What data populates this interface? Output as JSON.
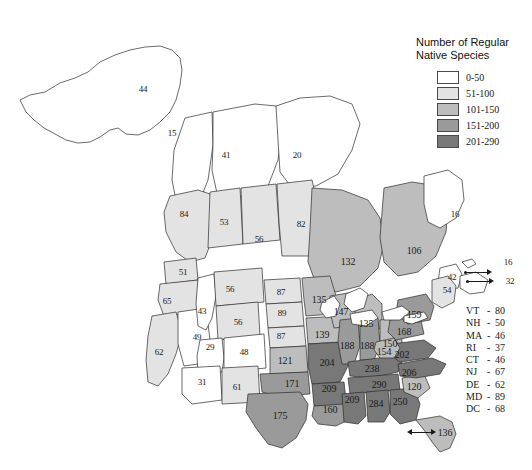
{
  "legend": {
    "title": "Number of Regular\nNative Species",
    "items": [
      {
        "label": "0-50",
        "color": "#ffffff"
      },
      {
        "label": "51-100",
        "color": "#e3e3e3"
      },
      {
        "label": "101-150",
        "color": "#bdbdbd"
      },
      {
        "label": "151-200",
        "color": "#9a9a9a"
      },
      {
        "label": "201-290",
        "color": "#787878"
      }
    ]
  },
  "state_list": [
    {
      "abbr": "VT",
      "value": "80"
    },
    {
      "abbr": "NH",
      "value": "50"
    },
    {
      "abbr": "MA",
      "value": "46"
    },
    {
      "abbr": "RI",
      "value": "37"
    },
    {
      "abbr": "CT",
      "value": "46"
    },
    {
      "abbr": "NJ",
      "value": "67"
    },
    {
      "abbr": "DE",
      "value": "62"
    },
    {
      "abbr": "MD",
      "value": "89"
    },
    {
      "abbr": "DC",
      "value": "68"
    }
  ],
  "chart_data": {
    "type": "map",
    "title": "Number of Regular Native Species",
    "legend_bins": [
      "0-50",
      "51-100",
      "101-150",
      "151-200",
      "201-290"
    ],
    "legend_colors": [
      "#ffffff",
      "#e3e3e3",
      "#bdbdbd",
      "#9a9a9a",
      "#787878"
    ],
    "regions": [
      {
        "name": "Alaska",
        "value": 44,
        "bin": "0-50",
        "x": 143,
        "y": 89
      },
      {
        "name": "Yukon",
        "value": 15,
        "bin": "0-50",
        "x": 172,
        "y": 133
      },
      {
        "name": "Northwest Territories",
        "value": 41,
        "bin": "0-50",
        "x": 226,
        "y": 155
      },
      {
        "name": "Nunavut",
        "value": 20,
        "bin": "0-50",
        "x": 297,
        "y": 155
      },
      {
        "name": "British Columbia",
        "value": 84,
        "bin": "51-100",
        "x": 184,
        "y": 214
      },
      {
        "name": "Alberta",
        "value": 53,
        "bin": "51-100",
        "x": 224,
        "y": 222
      },
      {
        "name": "Saskatchewan",
        "value": 56,
        "bin": "51-100",
        "x": 259,
        "y": 239
      },
      {
        "name": "Manitoba",
        "value": 82,
        "bin": "51-100",
        "x": 301,
        "y": 224
      },
      {
        "name": "Ontario",
        "value": 132,
        "bin": "101-150",
        "x": 348,
        "y": 261
      },
      {
        "name": "Quebec",
        "value": 106,
        "bin": "101-150",
        "x": 414,
        "y": 250
      },
      {
        "name": "Newfoundland and Labrador",
        "value": 16,
        "bin": "0-50",
        "x": 455,
        "y": 214
      },
      {
        "name": "New Brunswick",
        "value": 42,
        "bin": "0-50",
        "x": 452,
        "y": 277
      },
      {
        "name": "Prince Edward Island",
        "value": 16,
        "bin": "0-50",
        "x": 508,
        "y": 262
      },
      {
        "name": "Nova Scotia",
        "value": 32,
        "bin": "0-50",
        "x": 510,
        "y": 281
      },
      {
        "name": "Maine",
        "value": 54,
        "bin": "51-100",
        "x": 447,
        "y": 290
      },
      {
        "name": "Washington",
        "value": 51,
        "bin": "51-100",
        "x": 183,
        "y": 272
      },
      {
        "name": "Oregon",
        "value": 65,
        "bin": "51-100",
        "x": 167,
        "y": 301
      },
      {
        "name": "California",
        "value": 62,
        "bin": "51-100",
        "x": 159,
        "y": 352
      },
      {
        "name": "Nevada",
        "value": 49,
        "bin": "0-50",
        "x": 197,
        "y": 337
      },
      {
        "name": "Idaho",
        "value": 43,
        "bin": "0-50",
        "x": 202,
        "y": 311
      },
      {
        "name": "Montana",
        "value": 56,
        "bin": "51-100",
        "x": 230,
        "y": 289
      },
      {
        "name": "Wyoming",
        "value": 56,
        "bin": "51-100",
        "x": 238,
        "y": 322
      },
      {
        "name": "Utah",
        "value": 29,
        "bin": "0-50",
        "x": 210,
        "y": 347
      },
      {
        "name": "Colorado",
        "value": 48,
        "bin": "0-50",
        "x": 244,
        "y": 352
      },
      {
        "name": "Arizona",
        "value": 31,
        "bin": "0-50",
        "x": 202,
        "y": 382
      },
      {
        "name": "New Mexico",
        "value": 61,
        "bin": "51-100",
        "x": 237,
        "y": 387
      },
      {
        "name": "North Dakota",
        "value": 87,
        "bin": "51-100",
        "x": 281,
        "y": 292
      },
      {
        "name": "South Dakota",
        "value": 89,
        "bin": "51-100",
        "x": 282,
        "y": 313
      },
      {
        "name": "Nebraska",
        "value": 87,
        "bin": "51-100",
        "x": 281,
        "y": 336
      },
      {
        "name": "Kansas",
        "value": 121,
        "bin": "101-150",
        "x": 285,
        "y": 360
      },
      {
        "name": "Oklahoma",
        "value": 171,
        "bin": "151-200",
        "x": 292,
        "y": 383
      },
      {
        "name": "Texas",
        "value": 175,
        "bin": "151-200",
        "x": 280,
        "y": 415
      },
      {
        "name": "Minnesota",
        "value": 135,
        "bin": "101-150",
        "x": 319,
        "y": 299
      },
      {
        "name": "Iowa",
        "value": 139,
        "bin": "101-150",
        "x": 322,
        "y": 334
      },
      {
        "name": "Missouri",
        "value": 204,
        "bin": "201-290",
        "x": 327,
        "y": 362
      },
      {
        "name": "Arkansas",
        "value": 209,
        "bin": "201-290",
        "x": 329,
        "y": 388
      },
      {
        "name": "Louisiana",
        "value": 160,
        "bin": "151-200",
        "x": 330,
        "y": 409
      },
      {
        "name": "Wisconsin",
        "value": 147,
        "bin": "101-150",
        "x": 341,
        "y": 311
      },
      {
        "name": "Michigan",
        "value": 135,
        "bin": "101-150",
        "x": 366,
        "y": 323
      },
      {
        "name": "Illinois",
        "value": 188,
        "bin": "151-200",
        "x": 347,
        "y": 345
      },
      {
        "name": "Indiana",
        "value": 188,
        "bin": "151-200",
        "x": 367,
        "y": 345
      },
      {
        "name": "Ohio",
        "value": 150,
        "bin": "101-150",
        "x": 390,
        "y": 343
      },
      {
        "name": "Kentucky",
        "value": 238,
        "bin": "201-290",
        "x": 372,
        "y": 368
      },
      {
        "name": "Tennessee",
        "value": 290,
        "bin": "201-290",
        "x": 379,
        "y": 384
      },
      {
        "name": "Mississippi",
        "value": 209,
        "bin": "201-290",
        "x": 352,
        "y": 399
      },
      {
        "name": "Alabama",
        "value": 284,
        "bin": "201-290",
        "x": 376,
        "y": 403
      },
      {
        "name": "Georgia",
        "value": 250,
        "bin": "201-290",
        "x": 400,
        "y": 401
      },
      {
        "name": "Florida",
        "value": 136,
        "bin": "101-150",
        "x": 445,
        "y": 432
      },
      {
        "name": "South Carolina",
        "value": 120,
        "bin": "101-150",
        "x": 414,
        "y": 386
      },
      {
        "name": "North Carolina",
        "value": 206,
        "bin": "201-290",
        "x": 409,
        "y": 372
      },
      {
        "name": "Virginia",
        "value": 202,
        "bin": "201-290",
        "x": 402,
        "y": 354
      },
      {
        "name": "West Virginia",
        "value": 154,
        "bin": "101-150",
        "x": 384,
        "y": 351
      },
      {
        "name": "Pennsylvania",
        "value": 168,
        "bin": "151-200",
        "x": 404,
        "y": 331
      },
      {
        "name": "New York",
        "value": 159,
        "bin": "151-200",
        "x": 414,
        "y": 314
      }
    ],
    "callouts": [
      {
        "name": "Prince Edward Island",
        "value": "16"
      },
      {
        "name": "Nova Scotia",
        "value": "32"
      },
      {
        "name": "Florida",
        "value": "136"
      }
    ],
    "inset_list": [
      {
        "abbr": "VT",
        "value": 80
      },
      {
        "abbr": "NH",
        "value": 50
      },
      {
        "abbr": "MA",
        "value": 46
      },
      {
        "abbr": "RI",
        "value": 37
      },
      {
        "abbr": "CT",
        "value": 46
      },
      {
        "abbr": "NJ",
        "value": 67
      },
      {
        "abbr": "DE",
        "value": 62
      },
      {
        "abbr": "MD",
        "value": 89
      },
      {
        "abbr": "DC",
        "value": 68
      }
    ]
  }
}
